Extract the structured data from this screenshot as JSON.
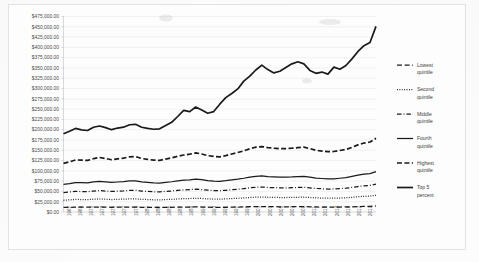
{
  "chart_data": {
    "type": "line",
    "title": "",
    "xlabel": "",
    "ylabel": "",
    "ylim": [
      0,
      475000
    ],
    "ytick_step": 25000,
    "grid": true,
    "legend_position": "right",
    "ytick_labels": [
      "$475,000.00",
      "$450,000.00",
      "$425,000.00",
      "$400,000.00",
      "$375,000.00",
      "$350,000.00",
      "$325,000.00",
      "$300,000.00",
      "$275,000.00",
      "$250,000.00",
      "$225,000.00",
      "$200,000.00",
      "$175,000.00",
      "$150,000.00",
      "$125,000.00",
      "$100,000.00",
      "$75,000.00",
      "$50,000.00",
      "$25,000.00",
      "$0.00"
    ],
    "ytick_values": [
      475000,
      450000,
      425000,
      400000,
      375000,
      350000,
      325000,
      300000,
      275000,
      250000,
      225000,
      200000,
      175000,
      150000,
      125000,
      100000,
      75000,
      50000,
      25000,
      0
    ],
    "x": [
      1967,
      1968,
      1969,
      1970,
      1971,
      1972,
      1973,
      1974,
      1975,
      1976,
      1977,
      1978,
      1979,
      1980,
      1981,
      1982,
      1983,
      1984,
      1985,
      1986,
      1987,
      1988,
      1989,
      1990,
      1991,
      1992,
      1993,
      1994,
      1995,
      1996,
      1997,
      1998,
      1999,
      2000,
      2001,
      2002,
      2003,
      2004,
      2005,
      2006,
      2007,
      2008,
      2009,
      2010,
      2011,
      2012,
      2013,
      2014,
      2015,
      2016,
      2017,
      2018,
      2019
    ],
    "xtick_labels": [
      "1967",
      "1969",
      "1971",
      "1973",
      "1975",
      "1977",
      "1979",
      "1981",
      "1983",
      "1985",
      "1987",
      "1989",
      "1991",
      "1993",
      "1995",
      "1997",
      "1999",
      "2001",
      "2003",
      "2005",
      "2007",
      "2009",
      "2011",
      "2013",
      "2014",
      "2016",
      "2017",
      "2019"
    ],
    "series": [
      {
        "name": "Lowest quintile",
        "style": "dashed",
        "values": [
          11000,
          11400,
          11900,
          11700,
          11600,
          11900,
          12100,
          11900,
          11500,
          11700,
          11800,
          12100,
          12000,
          11500,
          11200,
          11000,
          10900,
          11200,
          11400,
          11700,
          11900,
          12100,
          12400,
          12100,
          11600,
          11400,
          11200,
          11500,
          11900,
          12100,
          12500,
          12900,
          13200,
          13300,
          13000,
          12800,
          12700,
          12700,
          12800,
          12900,
          13000,
          12700,
          12200,
          12000,
          11900,
          11900,
          12100,
          12300,
          12700,
          13200,
          13600,
          13800,
          14600
        ]
      },
      {
        "name": "Second quintile",
        "style": "dotted",
        "values": [
          28500,
          29500,
          30500,
          30300,
          30100,
          31000,
          31600,
          31000,
          30300,
          30800,
          31200,
          31800,
          31800,
          30800,
          30200,
          29700,
          29500,
          30200,
          30800,
          31700,
          32300,
          32800,
          33400,
          32800,
          31900,
          31400,
          31100,
          31800,
          32600,
          33300,
          34200,
          35300,
          36100,
          36400,
          35800,
          35400,
          35200,
          35200,
          35400,
          35800,
          36000,
          35200,
          34300,
          33800,
          33400,
          33500,
          34000,
          34600,
          35800,
          37000,
          38100,
          38700,
          40600
        ]
      },
      {
        "name": "Middle quintile",
        "style": "dashdot",
        "values": [
          47000,
          48500,
          50000,
          49700,
          49400,
          51000,
          52000,
          51000,
          49900,
          50700,
          51300,
          52400,
          52600,
          50900,
          50000,
          49200,
          48900,
          50100,
          51100,
          52600,
          53600,
          54400,
          55400,
          54500,
          53000,
          52200,
          51700,
          52800,
          54200,
          55400,
          56900,
          58800,
          60200,
          60700,
          59700,
          59100,
          58700,
          58700,
          59100,
          59700,
          60100,
          58700,
          57200,
          56400,
          55700,
          55900,
          56800,
          57800,
          59800,
          61900,
          63600,
          64600,
          67800
        ]
      },
      {
        "name": "Fourth quintile",
        "style": "solid-thin",
        "values": [
          67000,
          69000,
          71500,
          71200,
          70800,
          73000,
          74700,
          73300,
          71700,
          72900,
          73800,
          75400,
          75700,
          73200,
          71900,
          70800,
          70400,
          72100,
          73500,
          75700,
          77200,
          78300,
          79800,
          78500,
          76300,
          75200,
          74500,
          76100,
          78100,
          79800,
          82000,
          84700,
          86700,
          87500,
          86100,
          85200,
          84600,
          84700,
          85200,
          86100,
          86700,
          84700,
          82500,
          81400,
          80400,
          80700,
          82000,
          83500,
          86300,
          89400,
          91800,
          93300,
          97900
        ]
      },
      {
        "name": "Highest quintile",
        "style": "dashed-thick",
        "values": [
          118000,
          122000,
          126500,
          126000,
          125300,
          129500,
          132500,
          130000,
          127000,
          129200,
          131000,
          134000,
          134500,
          130000,
          127800,
          126000,
          125500,
          128500,
          131500,
          135500,
          138500,
          140500,
          143500,
          141000,
          137000,
          135000,
          134000,
          137000,
          141000,
          144500,
          148500,
          153500,
          157500,
          159000,
          156500,
          155000,
          154000,
          154000,
          155000,
          156500,
          157500,
          154000,
          150000,
          148000,
          146500,
          147000,
          149500,
          152000,
          157000,
          163000,
          167500,
          170000,
          179000
        ]
      },
      {
        "name": "Top 5 percent",
        "style": "solid-thick",
        "values": [
          190000,
          196000,
          203000,
          199500,
          198000,
          206000,
          209000,
          205000,
          200000,
          204000,
          206000,
          212000,
          213000,
          206000,
          203000,
          201000,
          202000,
          210000,
          218000,
          232000,
          247000,
          244000,
          255000,
          248000,
          240000,
          244000,
          262000,
          278000,
          288000,
          299000,
          318000,
          330000,
          345000,
          357000,
          346000,
          338000,
          342000,
          351000,
          360000,
          365000,
          360000,
          344000,
          337000,
          340000,
          335000,
          352000,
          347000,
          356000,
          372000,
          390000,
          404000,
          412000,
          451000
        ]
      }
    ]
  },
  "legend": {
    "items": [
      {
        "label_line1": "Lowest",
        "label_line2": "quintile",
        "swatch": "dashed-line-swatch"
      },
      {
        "label_line1": "Second",
        "label_line2": "quintile",
        "swatch": "dotted-line-swatch"
      },
      {
        "label_line1": "Middle",
        "label_line2": "quintile",
        "swatch": "dashdot-line-swatch"
      },
      {
        "label_line1": "Fourth",
        "label_line2": "quintile",
        "swatch": "solid-thin-line-swatch"
      },
      {
        "label_line1": "Highest",
        "label_line2": "quintile",
        "swatch": "dashed-thick-line-swatch"
      },
      {
        "label_line1": "Top 5",
        "label_line2": "percent",
        "swatch": "solid-thick-line-swatch"
      }
    ]
  },
  "colors": {
    "series_stroke": "#1a1a1a",
    "gridline": "#e9e9e9",
    "axis": "#c9c9c9",
    "tick_text": "#4a4a4a",
    "background": "#fcfcfc",
    "frame_border": "#e2e2e2"
  }
}
